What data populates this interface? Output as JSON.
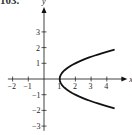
{
  "header": {
    "label": "103."
  },
  "chart_data": {
    "type": "line",
    "title": "",
    "xlabel": "x",
    "ylabel": "y",
    "xlim": [
      -2.3,
      4.8
    ],
    "ylim": [
      -3.3,
      4.2
    ],
    "xticks": [
      -2,
      -1,
      1,
      2,
      3,
      4
    ],
    "yticks": [
      -3,
      -2,
      -1,
      1,
      2,
      3
    ],
    "grid": false,
    "series": [
      {
        "name": "x = y^2 + 1",
        "equation": "x = y^2 + 1",
        "points": [
          [
            4.5,
            1.87
          ],
          [
            3.25,
            1.5
          ],
          [
            2,
            1
          ],
          [
            1.25,
            0.5
          ],
          [
            1,
            0
          ],
          [
            1.25,
            -0.5
          ],
          [
            2,
            -1
          ],
          [
            3.25,
            -1.5
          ],
          [
            4.5,
            -1.87
          ]
        ]
      }
    ]
  }
}
